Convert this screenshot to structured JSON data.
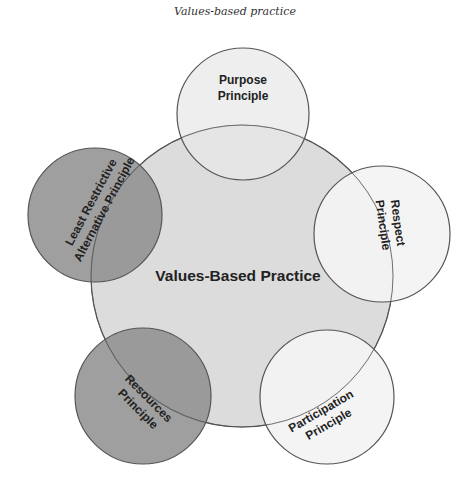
{
  "caption": "Values-based practice",
  "center": {
    "label": "Values-Based Practice",
    "fill": "#dcdcdc"
  },
  "principles": [
    {
      "id": "purpose",
      "line1": "Purpose",
      "line2": "Principle",
      "fill": "#e4e4e4"
    },
    {
      "id": "respect",
      "line1": "Respect",
      "line2": "Principle",
      "fill": "#f3f3f3"
    },
    {
      "id": "participation",
      "line1": "Participation",
      "line2": "Principle",
      "fill": "#f3f3f3"
    },
    {
      "id": "resources",
      "line1": "Resources",
      "line2": "Principle",
      "fill": "#999999"
    },
    {
      "id": "least-restrictive",
      "line1": "Least Restrictive",
      "line2": "Alternative Principle",
      "fill": "#999999"
    }
  ],
  "colors": {
    "stroke": "#555555",
    "text": "#222222"
  }
}
